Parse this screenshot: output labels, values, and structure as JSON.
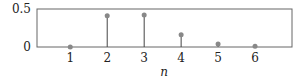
{
  "chart_data": {
    "type": "stem",
    "title": "",
    "xlabel": "n",
    "ylabel": "",
    "x": [
      1,
      2,
      3,
      4,
      5,
      6
    ],
    "values": [
      0.0,
      0.41,
      0.42,
      0.16,
      0.04,
      0.01
    ],
    "xticks": [
      "1",
      "2",
      "3",
      "4",
      "5",
      "6"
    ],
    "yticks": [
      "0",
      "0.5"
    ],
    "ylim": [
      0,
      0.5
    ],
    "xlim": [
      0.1,
      7.0
    ],
    "grid": false,
    "legend": null,
    "colors": {
      "stem": "#444444",
      "marker": "#888888",
      "frame": "#555555"
    }
  }
}
